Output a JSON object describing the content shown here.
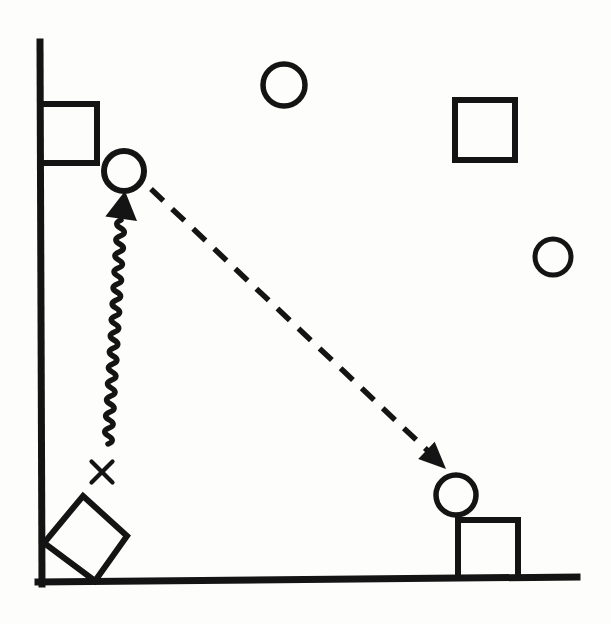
{
  "figure": {
    "background": "#fdfdfc",
    "ink": "#141414",
    "canvas": {
      "width": 611,
      "height": 624
    },
    "x_mark_label": "X",
    "shapes": [
      {
        "name": "y-axis",
        "type": "line",
        "x1": 40,
        "y1": 42,
        "x2": 42,
        "y2": 584,
        "stroke_width": 7
      },
      {
        "name": "x-axis",
        "type": "line",
        "x1": 38,
        "y1": 582,
        "x2": 577,
        "y2": 577,
        "stroke_width": 7
      },
      {
        "name": "square-upper-left",
        "type": "rect",
        "x": 40,
        "y": 104,
        "w": 57,
        "h": 59,
        "stroke_width": 6
      },
      {
        "name": "circle-upper-left",
        "type": "circle",
        "cx": 124,
        "cy": 171,
        "r": 20,
        "stroke_width": 6
      },
      {
        "name": "circle-top-middle",
        "type": "circle",
        "cx": 284,
        "cy": 85,
        "r": 21,
        "stroke_width": 5.5
      },
      {
        "name": "square-upper-right",
        "type": "rect",
        "x": 455,
        "y": 100,
        "w": 60,
        "h": 60,
        "stroke_width": 6
      },
      {
        "name": "circle-right",
        "type": "circle",
        "cx": 553,
        "cy": 257,
        "r": 18,
        "stroke_width": 5
      },
      {
        "name": "wavy-arrow",
        "type": "wavy_arrow",
        "from": [
          108,
          444
        ],
        "to": [
          121,
          220
        ],
        "amplitude": 8,
        "wavelength": 16,
        "stroke_width": 5.5,
        "head": {
          "tip": [
            125,
            191
          ],
          "length": 28,
          "half_width": 16
        }
      },
      {
        "name": "dashed-arrow",
        "type": "dashed_arrow",
        "from": [
          151,
          189
        ],
        "to": [
          429,
          452
        ],
        "tip": [
          446,
          469
        ],
        "dash": [
          17,
          12
        ],
        "stroke_width": 5.5,
        "head": {
          "length": 27,
          "half_width": 12
        }
      },
      {
        "name": "x-mark",
        "type": "x_mark",
        "cx": 102,
        "cy": 472,
        "size": 21,
        "stroke_width": 4.2,
        "label": "X"
      },
      {
        "name": "rotated-square",
        "type": "polygon",
        "points": [
          [
            83,
            496
          ],
          [
            127,
            536
          ],
          [
            95,
            581
          ],
          [
            44,
            543
          ]
        ],
        "stroke_width": 6
      },
      {
        "name": "circle-lower-right",
        "type": "circle",
        "cx": 456,
        "cy": 495,
        "r": 20,
        "stroke_width": 5.5
      },
      {
        "name": "square-lower-right",
        "type": "rect",
        "x": 458,
        "y": 520,
        "w": 60,
        "h": 58,
        "stroke_width": 6
      }
    ]
  }
}
